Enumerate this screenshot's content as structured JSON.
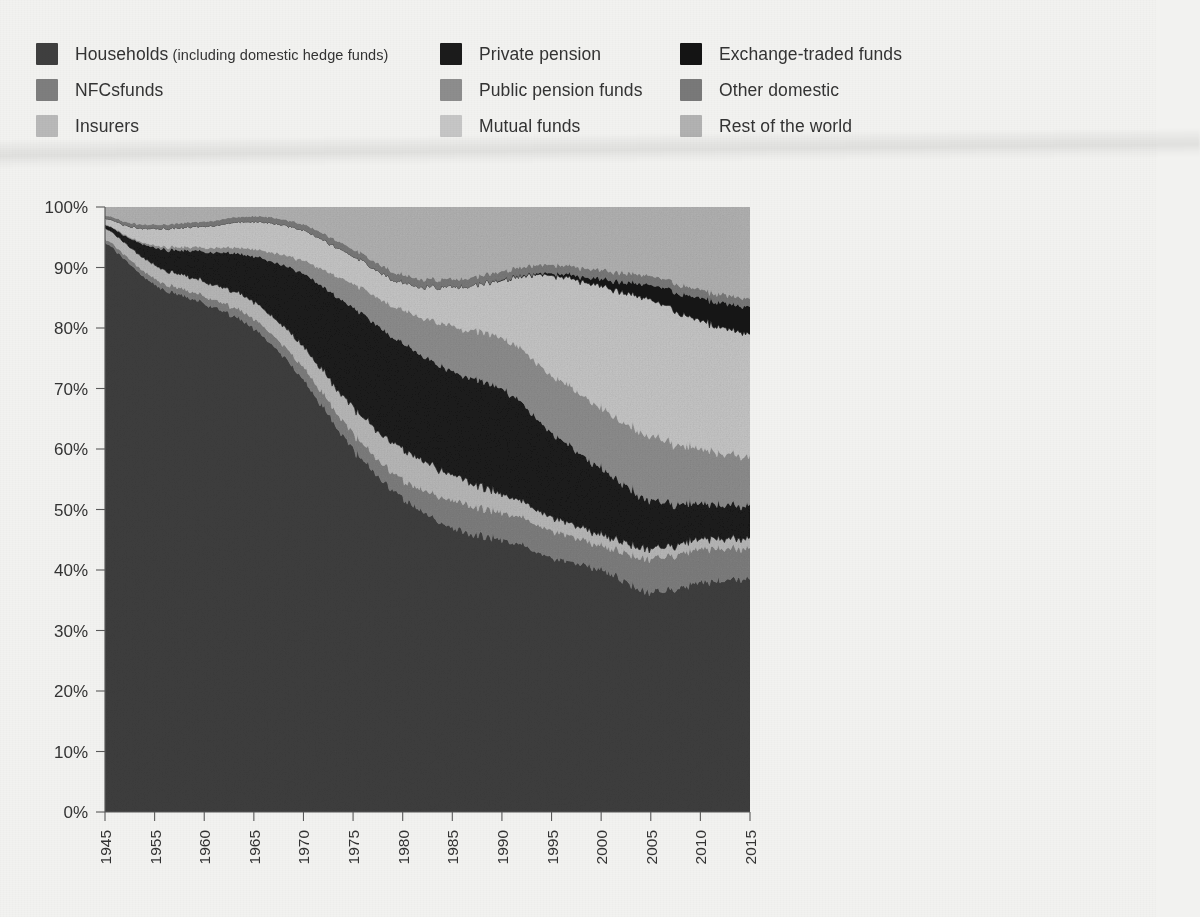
{
  "page": {
    "background_color": "#f2f2f0",
    "text_color": "#333333"
  },
  "legend": {
    "columns": [
      {
        "items": [
          {
            "label": "Households (including domestic hedge funds)",
            "main": "Households",
            "sub": " (including domestic hedge funds)",
            "color": "#3f3f3f",
            "key": "households"
          },
          {
            "label": "NFCsfunds",
            "main": "NFCsfunds",
            "sub": "",
            "color": "#7e7e7e",
            "key": "nfcs"
          },
          {
            "label": "Insurers",
            "main": "Insurers",
            "sub": "",
            "color": "#b9b9b9",
            "key": "insurers"
          }
        ]
      },
      {
        "items": [
          {
            "label": "Private pension",
            "main": "Private pension",
            "sub": "",
            "color": "#1b1b1b",
            "key": "private_pension"
          },
          {
            "label": "Public pension funds",
            "main": "Public pension funds",
            "sub": "",
            "color": "#8d8d8d",
            "key": "public_pension"
          },
          {
            "label": "Mutual funds",
            "main": "Mutual funds",
            "sub": "",
            "color": "#c6c6c6",
            "key": "mutual_funds"
          }
        ]
      },
      {
        "items": [
          {
            "label": "Exchange-traded funds",
            "main": "Exchange-traded funds",
            "sub": "",
            "color": "#141414",
            "key": "etf"
          },
          {
            "label": "Other domestic",
            "main": "Other domestic",
            "sub": "",
            "color": "#797979",
            "key": "other_domestic"
          },
          {
            "label": "Rest of the world",
            "main": "Rest of the world",
            "sub": "",
            "color": "#b2b2b2",
            "key": "rest_of_world"
          }
        ]
      }
    ]
  },
  "axes": {
    "y_ticks": [
      "0%",
      "10%",
      "20%",
      "30%",
      "40%",
      "50%",
      "60%",
      "70%",
      "80%",
      "90%",
      "100%"
    ],
    "x_ticks": [
      "1945",
      "1955",
      "1960",
      "1965",
      "1970",
      "1975",
      "1980",
      "1985",
      "1990",
      "1995",
      "2000",
      "2005",
      "2010",
      "2015"
    ]
  },
  "chart_data": {
    "type": "area",
    "title": "",
    "subtitle": "",
    "xlabel": "",
    "ylabel": "",
    "ylim": [
      0,
      100
    ],
    "xlim": [
      1945,
      2015
    ],
    "grid": false,
    "legend_position": "top",
    "stacked": true,
    "normalized_percent": true,
    "x_tick_labels": [
      "1945",
      "1955",
      "1960",
      "1965",
      "1970",
      "1975",
      "1980",
      "1985",
      "1990",
      "1995",
      "2000",
      "2005",
      "2010",
      "2015"
    ],
    "y_tick_labels": [
      "0%",
      "10%",
      "20%",
      "30%",
      "40%",
      "50%",
      "60%",
      "70%",
      "80%",
      "90%",
      "100%"
    ],
    "x": [
      1945,
      1950,
      1955,
      1960,
      1965,
      1970,
      1975,
      1980,
      1985,
      1990,
      1995,
      2000,
      2005,
      2010,
      2015
    ],
    "series": [
      {
        "name": "Households (including domestic hedge funds)",
        "color": "#3f3f3f",
        "values": [
          94.0,
          90.5,
          87.0,
          84.0,
          80.0,
          71.5,
          60.0,
          52.0,
          47.0,
          45.0,
          42.0,
          40.0,
          36.5,
          38.0,
          38.5
        ]
      },
      {
        "name": "NFCsfunds",
        "color": "#7e7e7e",
        "values": [
          0.6,
          0.8,
          1.0,
          1.2,
          1.6,
          2.0,
          2.6,
          3.0,
          4.5,
          4.5,
          4.5,
          4.0,
          5.5,
          5.5,
          5.0
        ]
      },
      {
        "name": "Insurers",
        "color": "#b9b9b9",
        "values": [
          1.8,
          2.0,
          2.2,
          2.4,
          2.8,
          3.4,
          4.2,
          5.0,
          4.2,
          3.0,
          2.2,
          1.8,
          1.6,
          1.6,
          1.6
        ]
      },
      {
        "name": "Private pension",
        "color": "#1b1b1b",
        "values": [
          0.6,
          1.5,
          3.0,
          5.0,
          7.5,
          12.0,
          16.5,
          17.5,
          17.0,
          17.5,
          14.0,
          11.0,
          8.0,
          6.0,
          5.5
        ]
      },
      {
        "name": "Public pension funds",
        "color": "#8d8d8d",
        "values": [
          0.1,
          0.2,
          0.4,
          0.7,
          1.2,
          2.2,
          4.0,
          5.5,
          7.5,
          8.5,
          9.5,
          10.0,
          10.5,
          9.0,
          8.0
        ]
      },
      {
        "name": "Mutual funds",
        "color": "#c6c6c6",
        "values": [
          1.0,
          1.8,
          2.8,
          3.5,
          4.5,
          5.0,
          4.5,
          4.5,
          6.5,
          9.5,
          16.5,
          20.0,
          22.5,
          21.0,
          20.5
        ]
      },
      {
        "name": "Exchange-traded funds",
        "color": "#141414",
        "values": [
          0.0,
          0.0,
          0.0,
          0.0,
          0.0,
          0.0,
          0.0,
          0.0,
          0.0,
          0.1,
          0.4,
          1.2,
          2.5,
          3.8,
          4.5
        ]
      },
      {
        "name": "Other domestic",
        "color": "#797979",
        "values": [
          0.5,
          0.6,
          0.7,
          0.8,
          0.9,
          1.0,
          1.2,
          1.3,
          1.3,
          1.4,
          1.4,
          1.5,
          1.5,
          1.4,
          1.4
        ]
      },
      {
        "name": "Rest of the world",
        "color": "#b2b2b2",
        "values": [
          1.4,
          2.6,
          2.9,
          2.4,
          1.5,
          2.9,
          7.0,
          11.2,
          12.0,
          10.5,
          9.5,
          10.5,
          11.4,
          13.7,
          15.0
        ]
      }
    ]
  }
}
